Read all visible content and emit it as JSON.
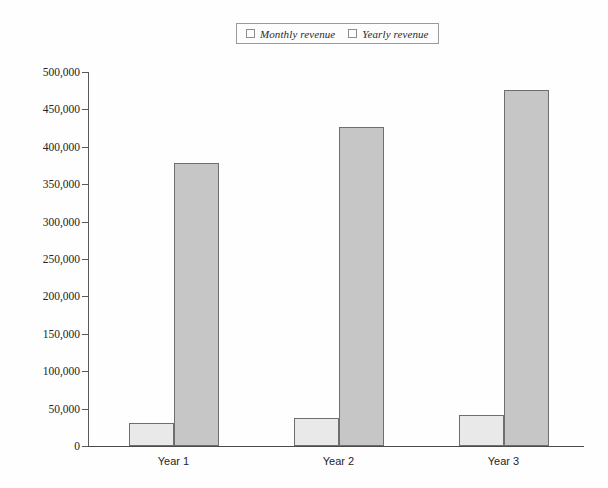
{
  "chart_data": {
    "type": "bar",
    "title": "",
    "xlabel": "",
    "ylabel": "",
    "categories": [
      "Year 1",
      "Year 2",
      "Year 3"
    ],
    "series": [
      {
        "name": "Monthly revenue",
        "color": "#e9e9e9",
        "values": [
          31000,
          37000,
          41000
        ]
      },
      {
        "name": "Yearly revenue",
        "color": "#c6c6c6",
        "values": [
          378000,
          426000,
          476000
        ]
      }
    ],
    "ylim": [
      0,
      500000
    ],
    "ytick_values": [
      0,
      50000,
      100000,
      150000,
      200000,
      250000,
      300000,
      350000,
      400000,
      450000,
      500000
    ],
    "ytick_labels": [
      "0",
      "50,000",
      "100,000",
      "150,000",
      "200,000",
      "250,000",
      "300,000",
      "350,000",
      "400,000",
      "450,000",
      "500,000"
    ],
    "grid": false,
    "legend_position": "top-center",
    "legend_entries": [
      "Monthly revenue",
      "Yearly revenue"
    ]
  }
}
